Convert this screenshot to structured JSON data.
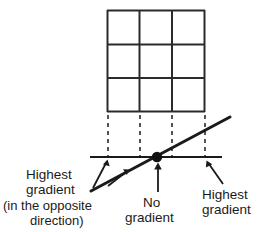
{
  "figure": {
    "title": "",
    "background_color": "#ffffff",
    "line_color": "#1a1a1a",
    "grid_color": "#2b2b2b"
  },
  "grid": {
    "name": "3x3-grid",
    "rows": 3,
    "cols": 3,
    "x_left": 107,
    "x_right": 205,
    "y_top": 10,
    "y_bottom": 112,
    "column_x": [
      107,
      139,
      172,
      205
    ],
    "row_y": [
      10,
      44,
      78,
      112
    ]
  },
  "dashed_guides": {
    "count": 4,
    "x_positions": [
      108,
      140,
      172,
      205
    ],
    "y_top": 114,
    "y_bottom": 156
  },
  "axis": {
    "name": "horizontal-axis",
    "x_start": 90,
    "x_end": 222,
    "y": 157
  },
  "slope_line": {
    "name": "gradient-line",
    "x1": 91,
    "y1": 191,
    "x2": 230,
    "y2": 117
  },
  "zero_point": {
    "name": "no-gradient-point",
    "x": 157,
    "y": 157,
    "radius": 5
  },
  "labels": {
    "left": {
      "lines": [
        "Highest",
        "gradient",
        "(in the opposite",
        "direction)"
      ]
    },
    "center": {
      "lines": [
        "No",
        "gradient"
      ]
    },
    "right": {
      "lines": [
        "Highest",
        "gradient"
      ]
    }
  },
  "arrows": [
    {
      "name": "arrow-left-highest-gradient",
      "from_x": 93,
      "from_y": 188,
      "to_x": 107,
      "to_y": 160
    },
    {
      "name": "arrow-left-secondary",
      "from_x": 108,
      "from_y": 186,
      "to_x": 127,
      "to_y": 171
    },
    {
      "name": "arrow-center-no-gradient",
      "from_x": 158,
      "from_y": 192,
      "to_x": 158,
      "to_y": 164
    },
    {
      "name": "arrow-right-highest-gradient",
      "from_x": 223,
      "from_y": 184,
      "to_x": 207,
      "to_y": 161
    }
  ]
}
